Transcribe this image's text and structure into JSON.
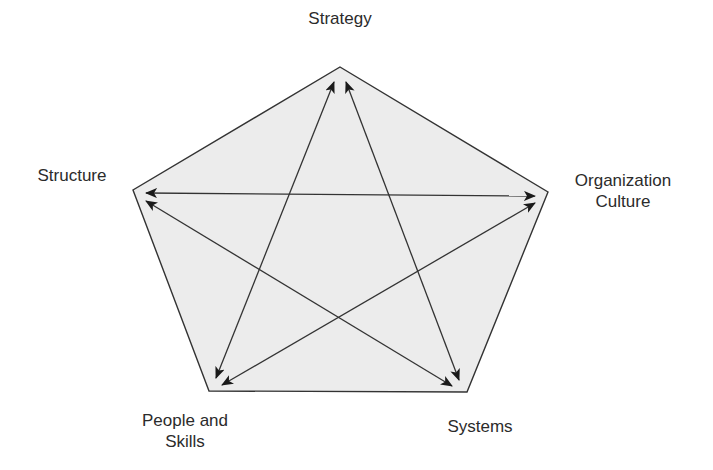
{
  "diagram": {
    "type": "pentagon-star",
    "colors": {
      "fill": "#ececec",
      "stroke": "#333333",
      "arrow": "#1a1a1a",
      "text": "#2b2b2b"
    },
    "nodes": [
      {
        "id": "strategy",
        "label": "Strategy",
        "lines": [
          "Strategy"
        ]
      },
      {
        "id": "structure",
        "label": "Structure",
        "lines": [
          "Structure"
        ]
      },
      {
        "id": "organization-culture",
        "label": "Organization Culture",
        "lines": [
          "Organization",
          "Culture"
        ]
      },
      {
        "id": "people-and-skills",
        "label": "People and Skills",
        "lines": [
          "People and",
          "Skills"
        ]
      },
      {
        "id": "systems",
        "label": "Systems",
        "lines": [
          "Systems"
        ]
      }
    ],
    "connections": [
      {
        "from": "structure",
        "to": "organization-culture",
        "bidirectional": true
      },
      {
        "from": "structure",
        "to": "systems",
        "bidirectional": true
      },
      {
        "from": "strategy",
        "to": "people-and-skills",
        "bidirectional": true
      },
      {
        "from": "strategy",
        "to": "systems",
        "bidirectional": true
      },
      {
        "from": "people-and-skills",
        "to": "organization-culture",
        "bidirectional": true
      }
    ]
  }
}
